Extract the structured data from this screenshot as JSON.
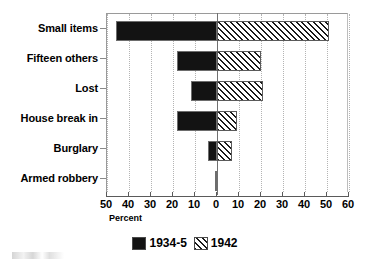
{
  "chart_data": {
    "type": "bar",
    "orientation": "horizontal",
    "layout": "diverging",
    "title": "",
    "xlabel": "Percent",
    "ylabel": "",
    "categories": [
      "Small items",
      "Fifteen others",
      "Lost",
      "House break in",
      "Burglary",
      "Armed robbery"
    ],
    "series": [
      {
        "name": "1934-5",
        "side": "left",
        "color": "#131313",
        "fill": "solid",
        "values": [
          46,
          18,
          12,
          18,
          4,
          1
        ]
      },
      {
        "name": "1942",
        "side": "right",
        "color": "#1a1a1a",
        "fill": "diagonal-hatch",
        "values": [
          51,
          20,
          21,
          9,
          7,
          0
        ]
      }
    ],
    "xlim": [
      -50,
      60
    ],
    "xticks": [
      -50,
      -40,
      -30,
      -20,
      -10,
      0,
      10,
      20,
      30,
      40,
      50,
      60
    ],
    "xtick_labels": [
      "50",
      "40",
      "30",
      "20",
      "10",
      "0",
      "10",
      "20",
      "30",
      "40",
      "50",
      "60"
    ],
    "grid": true,
    "grid_axis": "x",
    "legend_position": "bottom-center",
    "legend_entries": [
      "1934-5",
      "1942"
    ]
  },
  "axis": {
    "x_label": "Percent",
    "ticks": [
      {
        "label": "50",
        "value": -50
      },
      {
        "label": "40",
        "value": -40
      },
      {
        "label": "30",
        "value": -30
      },
      {
        "label": "20",
        "value": -20
      },
      {
        "label": "10",
        "value": -10
      },
      {
        "label": "0",
        "value": 0
      },
      {
        "label": "10",
        "value": 10
      },
      {
        "label": "20",
        "value": 20
      },
      {
        "label": "30",
        "value": 30
      },
      {
        "label": "40",
        "value": 40
      },
      {
        "label": "50",
        "value": 50
      },
      {
        "label": "60",
        "value": 60
      }
    ]
  },
  "rows": [
    {
      "label": "Small items",
      "left": 46,
      "right": 51
    },
    {
      "label": "Fifteen others",
      "left": 18,
      "right": 20
    },
    {
      "label": "Lost",
      "left": 12,
      "right": 21
    },
    {
      "label": "House break in",
      "left": 18,
      "right": 9
    },
    {
      "label": "Burglary",
      "left": 4,
      "right": 7
    },
    {
      "label": "Armed robbery",
      "left": 1,
      "right": 0
    }
  ],
  "legend": {
    "entries": [
      {
        "label": "1934-5",
        "fill": "solid"
      },
      {
        "label": "1942",
        "fill": "hatch"
      }
    ]
  },
  "colors": {
    "series_1934_5": "#131313",
    "series_1942_lines": "#1a1a1a",
    "grid": "#b4b4b4",
    "axis": "#5a5a5a",
    "background": "#ffffff"
  }
}
